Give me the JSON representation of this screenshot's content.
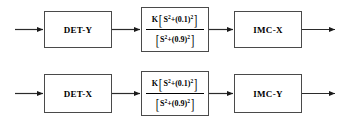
{
  "diagram": {
    "type": "block-diagram",
    "rows": [
      {
        "id": "row-x",
        "blocks": [
          {
            "id": "det-y",
            "kind": "labeled-block",
            "label": "DET-Y"
          },
          {
            "id": "tf-top",
            "kind": "transfer-function-block",
            "numerator": {
              "gain": "K",
              "open_bracket": "[",
              "variable": "S",
              "variable_exponent": "2",
              "operator": "+",
              "constant": "(0.1)",
              "constant_exponent": "2",
              "close_bracket": "]"
            },
            "denominator": {
              "open_bracket": "[",
              "variable": "S",
              "variable_exponent": "2",
              "operator": "+",
              "constant": "(0.9)",
              "constant_exponent": "2",
              "close_bracket": "]"
            }
          },
          {
            "id": "imc-x",
            "kind": "labeled-block",
            "label": "IMC-X"
          }
        ]
      },
      {
        "id": "row-y",
        "blocks": [
          {
            "id": "det-x",
            "kind": "labeled-block",
            "label": "DET-X"
          },
          {
            "id": "tf-bottom",
            "kind": "transfer-function-block",
            "numerator": {
              "gain": "K",
              "open_bracket": "[",
              "variable": "S",
              "variable_exponent": "2",
              "operator": "+",
              "constant": "(0.1)",
              "constant_exponent": "2",
              "close_bracket": "]"
            },
            "denominator": {
              "open_bracket": "[",
              "variable": "S",
              "variable_exponent": "2",
              "operator": "+",
              "constant": "(0.9)",
              "constant_exponent": "2",
              "close_bracket": "]"
            }
          },
          {
            "id": "imc-y",
            "kind": "labeled-block",
            "label": "IMC-Y"
          }
        ]
      }
    ],
    "colors": {
      "background": "#ffffff",
      "block_border": "#4a4a4a",
      "wire": "#2b2b2b",
      "text": "#000000"
    }
  }
}
